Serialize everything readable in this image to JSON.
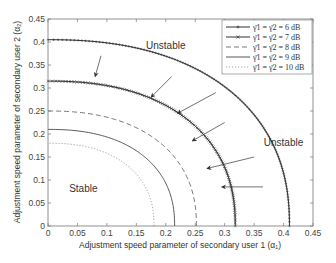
{
  "chart_data": {
    "type": "line",
    "title": "",
    "xlabel": "Adjustment speed parameter of secondary user 1 (α₁)",
    "ylabel": "Adjustment speed parameter of secondary user 2 (α₂)",
    "xlim": [
      0,
      0.45
    ],
    "ylim": [
      0,
      0.45
    ],
    "xticks": [
      0,
      0.05,
      0.1,
      0.15,
      0.2,
      0.25,
      0.3,
      0.35,
      0.4,
      0.45
    ],
    "yticks": [
      0,
      0.05,
      0.1,
      0.15,
      0.2,
      0.25,
      0.3,
      0.35,
      0.4,
      0.45
    ],
    "xtick_labels": [
      "0",
      "0.05",
      "0.1",
      "0.15",
      "0.2",
      "0.25",
      "0.3",
      "0.35",
      "0.4",
      "0.45"
    ],
    "ytick_labels": [
      "0",
      "0.05",
      "0.1",
      "0.15",
      "0.2",
      "0.25",
      "0.3",
      "0.35",
      "0.4",
      "0.45"
    ],
    "grid": false,
    "legend_position": "top-right",
    "series": [
      {
        "name": "γ̄1 = γ̄2 = 6 dB",
        "style": "solid-plus",
        "x_intercept": 0.41,
        "y_intercept": 0.405
      },
      {
        "name": "γ̄1 = γ̄2 = 7 dB",
        "style": "solid-x",
        "x_intercept": 0.318,
        "y_intercept": 0.315
      },
      {
        "name": "γ̄1 = γ̄2 = 8 dB",
        "style": "dashed",
        "x_intercept": 0.252,
        "y_intercept": 0.25
      },
      {
        "name": "γ̄1 = γ̄2 = 9 dB",
        "style": "solid",
        "x_intercept": 0.215,
        "y_intercept": 0.21
      },
      {
        "name": "γ̄1 = γ̄2 = 10 dB",
        "style": "dotted",
        "x_intercept": 0.18,
        "y_intercept": 0.18
      }
    ],
    "annotations": [
      {
        "text": "Unstable",
        "x": 0.2,
        "y": 0.385
      },
      {
        "text": "Unstable",
        "x": 0.4,
        "y": 0.175
      },
      {
        "text": "Stable",
        "x": 0.06,
        "y": 0.075
      }
    ],
    "arrows": [
      {
        "from": [
          0.09,
          0.37
        ],
        "to": [
          0.08,
          0.325
        ]
      },
      {
        "from": [
          0.21,
          0.325
        ],
        "to": [
          0.175,
          0.28
        ]
      },
      {
        "from": [
          0.285,
          0.29
        ],
        "to": [
          0.22,
          0.245
        ]
      },
      {
        "from": [
          0.3,
          0.225
        ],
        "to": [
          0.245,
          0.185
        ]
      },
      {
        "from": [
          0.35,
          0.15
        ],
        "to": [
          0.27,
          0.125
        ]
      },
      {
        "from": [
          0.365,
          0.085
        ],
        "to": [
          0.295,
          0.085
        ]
      }
    ],
    "colors": {
      "axis": "#555555",
      "line": "#333333",
      "dashed": "#555555",
      "dotted": "#999999"
    }
  }
}
